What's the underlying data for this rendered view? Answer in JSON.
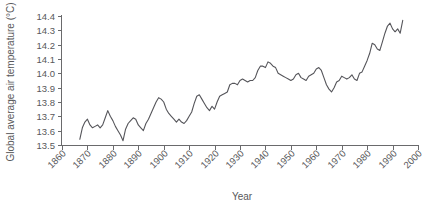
{
  "chart_data": {
    "type": "line",
    "title": "",
    "xlabel": "Year",
    "ylabel": "Global average air temperature (°C)",
    "xlim": [
      1860,
      2000
    ],
    "ylim": [
      13.5,
      14.4
    ],
    "grid": false,
    "legend": "none",
    "xticks": [
      1860,
      1870,
      1880,
      1890,
      1900,
      1910,
      1920,
      1930,
      1940,
      1950,
      1960,
      1970,
      1980,
      1990,
      2000
    ],
    "yticks": [
      "13.5",
      "13.6",
      "13.7",
      "13.8",
      "13.9",
      "14.0",
      "14.1",
      "14.2",
      "14.3",
      "14.4"
    ],
    "series": [
      {
        "name": "Global average air temperature",
        "color": "#55555a",
        "x": [
          1867,
          1868,
          1869,
          1870,
          1871,
          1872,
          1873,
          1874,
          1875,
          1876,
          1877,
          1878,
          1879,
          1880,
          1881,
          1882,
          1883,
          1884,
          1885,
          1886,
          1887,
          1888,
          1889,
          1890,
          1891,
          1892,
          1893,
          1894,
          1895,
          1896,
          1897,
          1898,
          1899,
          1900,
          1901,
          1902,
          1903,
          1904,
          1905,
          1906,
          1907,
          1908,
          1909,
          1910,
          1911,
          1912,
          1913,
          1914,
          1915,
          1916,
          1917,
          1918,
          1919,
          1920,
          1921,
          1922,
          1923,
          1924,
          1925,
          1926,
          1927,
          1928,
          1929,
          1930,
          1931,
          1932,
          1933,
          1934,
          1935,
          1936,
          1937,
          1938,
          1939,
          1940,
          1941,
          1942,
          1943,
          1944,
          1945,
          1946,
          1947,
          1948,
          1949,
          1950,
          1951,
          1952,
          1953,
          1954,
          1955,
          1956,
          1957,
          1958,
          1959,
          1960,
          1961,
          1962,
          1963,
          1964,
          1965,
          1966,
          1967,
          1968,
          1969,
          1970,
          1971,
          1972,
          1973,
          1974,
          1975,
          1976,
          1977,
          1978,
          1979,
          1980,
          1981,
          1982,
          1983,
          1984,
          1985,
          1986,
          1987,
          1988,
          1989,
          1990,
          1991,
          1992,
          1993,
          1994
        ],
        "y": [
          13.54,
          13.62,
          13.66,
          13.68,
          13.64,
          13.62,
          13.63,
          13.64,
          13.62,
          13.64,
          13.69,
          13.74,
          13.7,
          13.67,
          13.63,
          13.6,
          13.57,
          13.53,
          13.61,
          13.65,
          13.67,
          13.69,
          13.68,
          13.64,
          13.62,
          13.6,
          13.65,
          13.68,
          13.72,
          13.76,
          13.8,
          13.83,
          13.82,
          13.8,
          13.75,
          13.72,
          13.7,
          13.68,
          13.66,
          13.68,
          13.66,
          13.65,
          13.67,
          13.7,
          13.73,
          13.79,
          13.84,
          13.85,
          13.82,
          13.79,
          13.76,
          13.74,
          13.77,
          13.75,
          13.8,
          13.84,
          13.85,
          13.86,
          13.87,
          13.92,
          13.93,
          13.93,
          13.92,
          13.95,
          13.96,
          13.95,
          13.94,
          13.95,
          13.95,
          13.97,
          14.02,
          14.05,
          14.05,
          14.04,
          14.08,
          14.07,
          14.05,
          14.04,
          14.0,
          13.99,
          13.98,
          13.97,
          13.96,
          13.95,
          13.96,
          13.99,
          14.0,
          13.97,
          13.96,
          13.95,
          13.98,
          13.99,
          14.0,
          14.03,
          14.04,
          14.02,
          13.97,
          13.92,
          13.89,
          13.87,
          13.9,
          13.94,
          13.95,
          13.98,
          13.97,
          13.96,
          13.97,
          13.99,
          13.96,
          13.95,
          14.0,
          14.01,
          14.05,
          14.09,
          14.14,
          14.21,
          14.2,
          14.17,
          14.16,
          14.22,
          14.28,
          14.33,
          14.35,
          14.31,
          14.29,
          14.31,
          14.28,
          14.37
        ]
      }
    ]
  }
}
